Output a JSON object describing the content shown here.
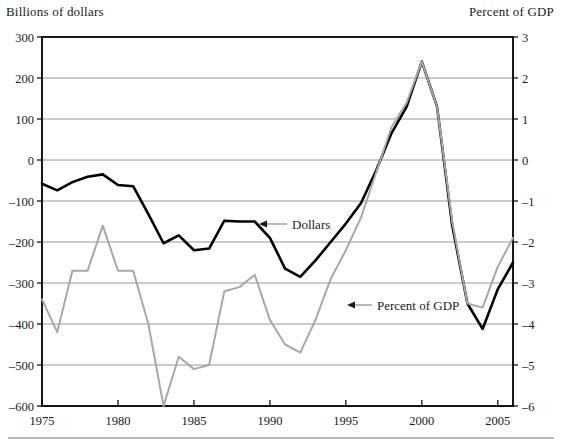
{
  "figure": {
    "left_axis_title": "Billions of dollars",
    "right_axis_title": "Percent of GDP",
    "annotations": [
      {
        "name": "dollars",
        "label": "Dollars"
      },
      {
        "name": "percent-of-gdp",
        "label": "Percent of GDP"
      }
    ],
    "colors": {
      "dollars_line": "#000000",
      "percent_line": "#a8a8a8",
      "grid": "#8c8c8c",
      "frame": "#000000",
      "background": "#ffffff"
    }
  },
  "chart_data": {
    "type": "line",
    "title": "",
    "subtitle": "",
    "xlabel": "",
    "ylabel": "Billions of dollars",
    "y2label": "Percent of GDP",
    "xlim": [
      1975,
      2006
    ],
    "ylim": [
      -600,
      300
    ],
    "y2lim": [
      -6,
      3
    ],
    "grid": true,
    "legend": "annotated-inline",
    "x_ticks": [
      1975,
      1980,
      1985,
      1990,
      1995,
      2000,
      2005
    ],
    "y_ticks": [
      -600,
      -500,
      -400,
      -300,
      -200,
      -100,
      0,
      100,
      200,
      300
    ],
    "y2_ticks": [
      -6,
      -5,
      -4,
      -3,
      -2,
      -1,
      0,
      1,
      2,
      3
    ],
    "x": [
      1975,
      1976,
      1977,
      1978,
      1979,
      1980,
      1981,
      1982,
      1983,
      1984,
      1985,
      1986,
      1987,
      1988,
      1989,
      1990,
      1991,
      1992,
      1993,
      1994,
      1995,
      1996,
      1997,
      1998,
      1999,
      2000,
      2001,
      2002,
      2003,
      2004,
      2005,
      2006
    ],
    "series": [
      {
        "name": "Dollars",
        "axis": "left",
        "units": "Billions of dollars",
        "color": "#000000",
        "values": [
          -58,
          -74,
          -54,
          -41,
          -35,
          -61,
          -64,
          -132,
          -203,
          -184,
          -220,
          -216,
          -148,
          -150,
          -150,
          -190,
          -265,
          -285,
          -245,
          -200,
          -155,
          -105,
          -25,
          65,
          130,
          240,
          130,
          -160,
          -350,
          -412,
          -315,
          -250
        ]
      },
      {
        "name": "Percent of GDP",
        "axis": "right",
        "units": "Percent of GDP",
        "color": "#a8a8a8",
        "values": [
          -3.4,
          -4.2,
          -2.7,
          -2.7,
          -1.6,
          -2.7,
          -2.7,
          -4.0,
          -6.0,
          -4.8,
          -5.1,
          -5.0,
          -3.2,
          -3.1,
          -2.8,
          -3.9,
          -4.5,
          -4.7,
          -3.9,
          -2.9,
          -2.2,
          -1.4,
          -0.3,
          0.8,
          1.4,
          2.4,
          1.3,
          -1.5,
          -3.5,
          -3.6,
          -2.6,
          -1.9
        ]
      }
    ]
  }
}
